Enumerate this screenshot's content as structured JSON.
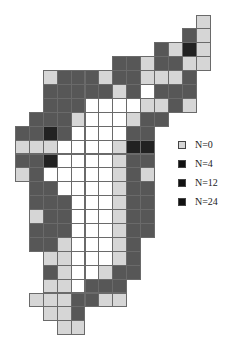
{
  "map": {
    "grid": {
      "origin_x": 15,
      "origin_y": 14.5,
      "cell_size": 13.9,
      "colors": {
        "W": "#ffffff",
        "L": "#d6d6d6",
        "D": "#575757",
        "K": "#222222"
      },
      "rows": [
        ".............L",
        "............DL",
        "..........DLKL",
        ".......DDLDDLL",
        "..LDDDLDDLLLD.",
        "..DDDDDLDWDDD.",
        "..DDDWWWWLLDL.",
        ".DDDLWWWLDD...",
        "DDKDWWWWDD....",
        "LLLWWWWLKK....",
        "DDKWWWWLDD....",
        "LDWWWWWLDL....",
        ".DDWWWWLDD....",
        ".DDDWWWLDD....",
        ".LDDWWWLDD....",
        ".DDDWWWLDD....",
        ".DDLWWWLD.....",
        "..LLWWWLD.....",
        "..DLWWLDD.....",
        "..LLWDDD......",
        ".LLLDDLL......",
        "..LLD.........",
        "...LL........."
      ]
    }
  },
  "legend": {
    "items": [
      {
        "label": "N=0",
        "color": "#d6d6d6"
      },
      {
        "label": "N=4",
        "color": "#111111"
      },
      {
        "label": "N=12",
        "color": "#111111"
      },
      {
        "label": "N=24",
        "color": "#111111"
      }
    ]
  }
}
